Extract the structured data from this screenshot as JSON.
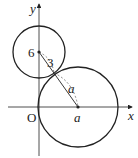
{
  "diagram": {
    "labels": {
      "y_axis": "y",
      "x_axis": "x",
      "origin": "O",
      "center_small_y": "6",
      "radius_small": "3",
      "radius_large": "a",
      "center_large_x": "a"
    },
    "small_circle": {
      "center": [
        0,
        6
      ],
      "radius": 3
    },
    "large_circle": {
      "center": [
        "a",
        0
      ],
      "radius": "a"
    },
    "colors": {
      "stroke": "#222222",
      "dashed": "#555555"
    }
  }
}
